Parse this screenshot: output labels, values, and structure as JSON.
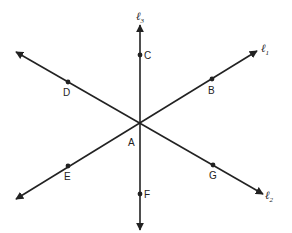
{
  "diagram": {
    "type": "intersecting-lines",
    "line_color": "#222222",
    "background": "#ffffff",
    "intersection_point": "A",
    "lines": [
      {
        "name": "l1",
        "label": "ℓ",
        "subscript": "1",
        "points": [
          "E",
          "A",
          "B"
        ]
      },
      {
        "name": "l2",
        "label": "ℓ",
        "subscript": "2",
        "points": [
          "D",
          "A",
          "G"
        ]
      },
      {
        "name": "l3",
        "label": "ℓ",
        "subscript": "3",
        "points": [
          "C",
          "A",
          "F"
        ]
      }
    ],
    "points": {
      "A": "A",
      "B": "B",
      "C": "C",
      "D": "D",
      "E": "E",
      "F": "F",
      "G": "G"
    }
  }
}
